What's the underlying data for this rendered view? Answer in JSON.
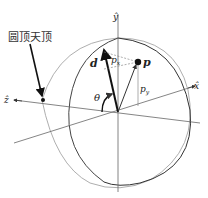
{
  "figure": {
    "callout_label": "圆顶天顶",
    "axes": {
      "x": "x̂",
      "y": "ŷ",
      "z": "ẑ"
    },
    "vector_label": "d",
    "point_label": "p",
    "px_label": "p",
    "px_sub": "x",
    "py_label": "p",
    "py_sub": "y",
    "angle_label": "θ"
  }
}
